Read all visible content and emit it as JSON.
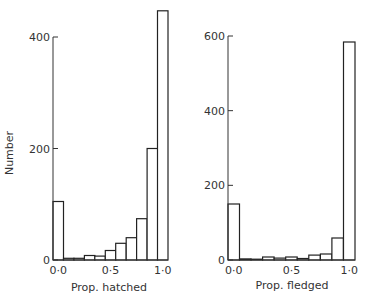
{
  "chart_data": [
    {
      "type": "bar",
      "title": "",
      "xlabel": "Prop. hatched",
      "ylabel": "Number",
      "categories": [
        "0.0",
        "0.1",
        "0.2",
        "0.3",
        "0.4",
        "0.5",
        "0.6",
        "0.7",
        "0.8",
        "0.9",
        "1.0"
      ],
      "values": [
        105,
        3,
        3,
        8,
        7,
        17,
        30,
        40,
        74,
        200,
        447
      ],
      "x_tick_labels": [
        "0·0",
        "0·5",
        "1·0"
      ],
      "y_ticks": [
        0,
        200,
        400
      ],
      "ylim": [
        0,
        450
      ],
      "grid": false,
      "legend": null
    },
    {
      "type": "bar",
      "title": "",
      "xlabel": "Prop. fledged",
      "ylabel": "",
      "categories": [
        "0.0",
        "0.1",
        "0.2",
        "0.3",
        "0.4",
        "0.5",
        "0.6",
        "0.7",
        "0.8",
        "0.9",
        "1.0"
      ],
      "values": [
        150,
        3,
        0,
        8,
        5,
        8,
        4,
        13,
        16,
        59,
        584
      ],
      "x_tick_labels": [
        "0·0",
        "0·5",
        "1·0"
      ],
      "y_ticks": [
        0,
        200,
        400,
        600
      ],
      "ylim": [
        0,
        600
      ],
      "grid": false,
      "legend": null
    }
  ],
  "labels": {
    "left_ylabel": "Number",
    "left_xlabel": "Prop. hatched",
    "right_xlabel": "Prop. fledged",
    "left_yticks": [
      "0",
      "200",
      "400"
    ],
    "right_yticks": [
      "0",
      "200",
      "400",
      "600"
    ],
    "xticks": [
      "0·0",
      "0·5",
      "1·0"
    ]
  }
}
